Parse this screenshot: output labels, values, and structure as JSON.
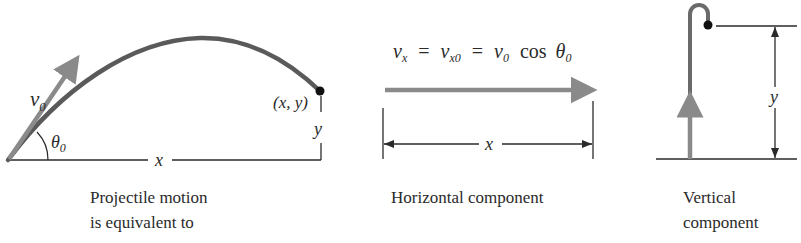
{
  "colors": {
    "arrow_gray": "#8a8a8a",
    "trajectory": "#5a5a5a",
    "line": "#2a2a2a",
    "point": "#111111"
  },
  "panel_projectile": {
    "velocity_label": "v",
    "velocity_sub": "0",
    "angle_label": "θ",
    "angle_sub": "0",
    "point_label": "(x, y)",
    "x_label": "x",
    "y_label": "y",
    "caption_line1": "Projectile motion",
    "caption_line2": "is equivalent to"
  },
  "panel_horizontal": {
    "equation": {
      "vx": "v",
      "vx_sub": "x",
      "eq1": "=",
      "vx0": "v",
      "vx0_sub": "x0",
      "eq2": "=",
      "v0": "v",
      "v0_sub": "0",
      "cos": "cos",
      "theta": "θ",
      "theta_sub": "0"
    },
    "x_label": "x",
    "caption": "Horizontal component"
  },
  "panel_vertical": {
    "y_label": "y",
    "caption_line1": "Vertical",
    "caption_line2": "component"
  }
}
